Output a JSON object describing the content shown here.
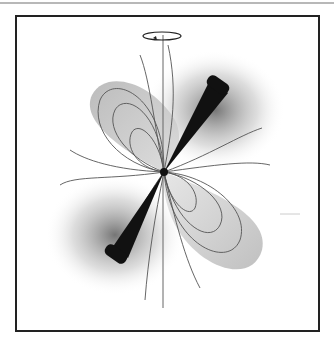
{
  "figure": {
    "elements": [
      "rotation-axis",
      "rotation-arrow",
      "neutron-star",
      "radiation-beam",
      "magnetic-field-lines",
      "glow"
    ]
  },
  "colors": {
    "frame": "#222222",
    "beam": "#111111",
    "field_line": "#555555",
    "lobe_fill": "#9a9a9a",
    "background": "#ffffff"
  }
}
